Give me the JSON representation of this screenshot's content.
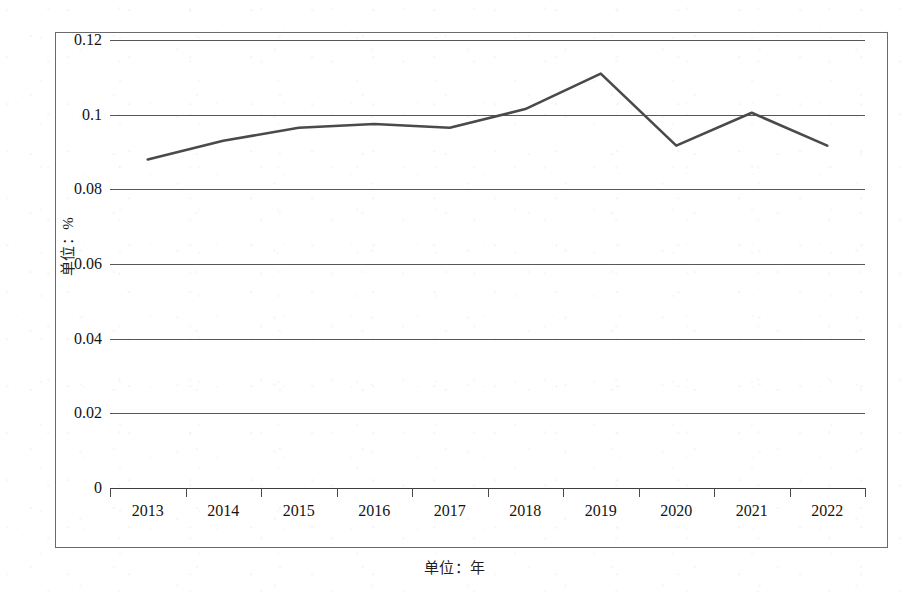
{
  "chart_data": {
    "type": "line",
    "title": "",
    "xlabel": "单位：年",
    "ylabel": "单位：%",
    "categories": [
      "2013",
      "2014",
      "2015",
      "2016",
      "2017",
      "2018",
      "2019",
      "2020",
      "2021",
      "2022"
    ],
    "series": [
      {
        "name": "比重",
        "values": [
          0.088,
          0.093,
          0.0965,
          0.0975,
          0.0965,
          0.1015,
          0.111,
          0.0917,
          0.1005,
          0.0917
        ]
      }
    ],
    "ylim": [
      0,
      0.12
    ],
    "ytick_labels": [
      "0",
      "0.02",
      "0.04",
      "0.06",
      "0.08",
      "0.1",
      "0.12"
    ],
    "ytick_values": [
      0,
      0.02,
      0.04,
      0.06,
      0.08,
      0.1,
      0.12
    ],
    "grid": true,
    "grid_axis": "y",
    "legend": false,
    "legend_position": "none",
    "line_color": "#4a4a4a",
    "line_width": 2.6,
    "markers": false,
    "frame": true
  },
  "figure": {
    "border_color": "#6a6a6a",
    "background": "#ffffff"
  }
}
